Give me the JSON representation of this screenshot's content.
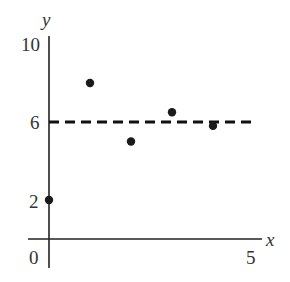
{
  "title_partial": "Dots Plot Title",
  "chart_data": {
    "type": "scatter",
    "title": "",
    "xlabel": "x",
    "ylabel": "y",
    "xlim": [
      0,
      5
    ],
    "ylim": [
      0,
      10
    ],
    "x_ticks": [
      "0",
      "5"
    ],
    "y_ticks": [
      "2",
      "6",
      "10"
    ],
    "grid": false,
    "legend": null,
    "series": [
      {
        "name": "points",
        "x": [
          0,
          1,
          2,
          3,
          4
        ],
        "y": [
          2,
          8,
          5,
          6.5,
          5.8
        ]
      }
    ],
    "reference_lines": [
      {
        "type": "horizontal",
        "y": 6,
        "style": "dashed",
        "label": "mean"
      }
    ]
  },
  "labels": {
    "y_axis": "y",
    "x_axis": "x",
    "tick_y_10": "10",
    "tick_y_6": "6",
    "tick_y_2": "2",
    "tick_x_0": "0",
    "tick_x_5": "5"
  },
  "colors": {
    "ink": "#1a1a1a",
    "background": "#ffffff"
  }
}
